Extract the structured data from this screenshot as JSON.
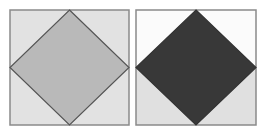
{
  "figure": {
    "panels": [
      {
        "id": "left",
        "box": {
          "x": 10,
          "y": 10,
          "w": 119,
          "h": 115
        },
        "background": "#e2e2e2",
        "diamond_fill": "#b9b9b9",
        "stroke": "#555555",
        "split_background": false
      },
      {
        "id": "right",
        "box": {
          "x": 136,
          "y": 10,
          "w": 120,
          "h": 115
        },
        "background_top": "#fbfbfb",
        "background_bottom": "#e0e0e0",
        "diamond_fill": "#383838",
        "stroke": "#333333",
        "split_background": true
      }
    ],
    "colors": {
      "frame": "#8a8a8a",
      "page": "#ffffff"
    }
  }
}
